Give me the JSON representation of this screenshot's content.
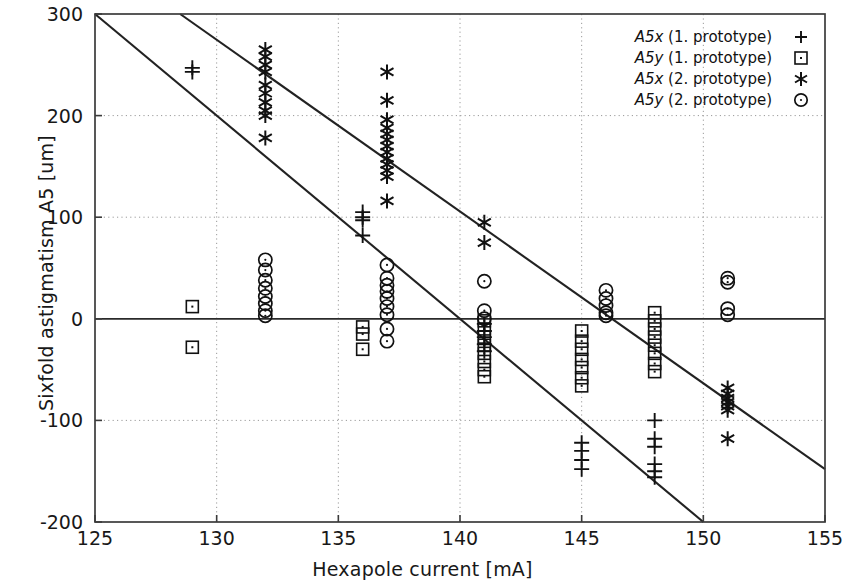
{
  "chart_data": {
    "type": "scatter",
    "title": "",
    "xlabel": "Hexapole current [mA]",
    "ylabel": "Sixfold astigmatism A5 [um]",
    "xlim": [
      125,
      155
    ],
    "ylim": [
      -200,
      300
    ],
    "xticks": [
      125,
      130,
      135,
      140,
      145,
      150,
      155
    ],
    "yticks": [
      -200,
      -100,
      0,
      100,
      200,
      300
    ],
    "grid": true,
    "grid_style": "dotted",
    "legend_position": "top-right",
    "legend": [
      {
        "label": "A5x (1. prototype)",
        "italic_part": "A5x",
        "rest": " (1. prototype)",
        "marker": "plus"
      },
      {
        "label": "A5y (1. prototype)",
        "italic_part": "A5y",
        "rest": " (1. prototype)",
        "marker": "square"
      },
      {
        "label": "A5x (2. prototype)",
        "italic_part": "A5x",
        "rest": " (2. prototype)",
        "marker": "asterisk"
      },
      {
        "label": "A5y (2. prototype)",
        "italic_part": "A5y",
        "rest": " (2. prototype)",
        "marker": "circle"
      }
    ],
    "series": [
      {
        "name": "A5x (1. prototype)",
        "marker": "plus",
        "points": [
          [
            129,
            247
          ],
          [
            129,
            243
          ],
          [
            136,
            105
          ],
          [
            136,
            100
          ],
          [
            136,
            97
          ],
          [
            136,
            82
          ],
          [
            141,
            -5
          ],
          [
            141,
            -12
          ],
          [
            141,
            -18
          ],
          [
            141,
            -25
          ],
          [
            141,
            -32
          ],
          [
            145,
            -122
          ],
          [
            145,
            -130
          ],
          [
            145,
            -139
          ],
          [
            145,
            -148
          ],
          [
            148,
            -100
          ],
          [
            148,
            -118
          ],
          [
            148,
            -126
          ],
          [
            148,
            -143
          ],
          [
            148,
            -150
          ],
          [
            148,
            -156
          ]
        ]
      },
      {
        "name": "A5y (1. prototype)",
        "marker": "square",
        "points": [
          [
            129,
            12
          ],
          [
            129,
            -28
          ],
          [
            136,
            -8
          ],
          [
            136,
            -15
          ],
          [
            136,
            -30
          ],
          [
            141,
            -2
          ],
          [
            141,
            -10
          ],
          [
            141,
            -18
          ],
          [
            141,
            -26
          ],
          [
            141,
            -34
          ],
          [
            141,
            -42
          ],
          [
            141,
            -50
          ],
          [
            141,
            -57
          ],
          [
            145,
            -12
          ],
          [
            145,
            -22
          ],
          [
            145,
            -30
          ],
          [
            145,
            -40
          ],
          [
            145,
            -48
          ],
          [
            145,
            -58
          ],
          [
            145,
            -66
          ],
          [
            148,
            6
          ],
          [
            148,
            -2
          ],
          [
            148,
            -10
          ],
          [
            148,
            -18
          ],
          [
            148,
            -26
          ],
          [
            148,
            -34
          ],
          [
            148,
            -44
          ],
          [
            148,
            -52
          ]
        ]
      },
      {
        "name": "A5x (2. prototype)",
        "marker": "asterisk",
        "points": [
          [
            132,
            265
          ],
          [
            132,
            258
          ],
          [
            132,
            250
          ],
          [
            132,
            243
          ],
          [
            132,
            230
          ],
          [
            132,
            222
          ],
          [
            132,
            213
          ],
          [
            132,
            205
          ],
          [
            132,
            200
          ],
          [
            132,
            178
          ],
          [
            137,
            243
          ],
          [
            137,
            215
          ],
          [
            137,
            196
          ],
          [
            137,
            188
          ],
          [
            137,
            182
          ],
          [
            137,
            176
          ],
          [
            137,
            170
          ],
          [
            137,
            164
          ],
          [
            137,
            158
          ],
          [
            137,
            152
          ],
          [
            137,
            146
          ],
          [
            137,
            140
          ],
          [
            137,
            116
          ],
          [
            141,
            95
          ],
          [
            141,
            75
          ],
          [
            151,
            -68
          ],
          [
            151,
            -74
          ],
          [
            151,
            -78
          ],
          [
            151,
            -82
          ],
          [
            151,
            -86
          ],
          [
            151,
            -90
          ],
          [
            151,
            -118
          ]
        ]
      },
      {
        "name": "A5y (2. prototype)",
        "marker": "circle",
        "points": [
          [
            132,
            58
          ],
          [
            132,
            48
          ],
          [
            132,
            38
          ],
          [
            132,
            30
          ],
          [
            132,
            22
          ],
          [
            132,
            15
          ],
          [
            132,
            8
          ],
          [
            132,
            3
          ],
          [
            137,
            53
          ],
          [
            137,
            40
          ],
          [
            137,
            33
          ],
          [
            137,
            27
          ],
          [
            137,
            20
          ],
          [
            137,
            12
          ],
          [
            137,
            4
          ],
          [
            137,
            -10
          ],
          [
            137,
            -22
          ],
          [
            141,
            37
          ],
          [
            141,
            8
          ],
          [
            141,
            0
          ],
          [
            146,
            28
          ],
          [
            146,
            20
          ],
          [
            146,
            13
          ],
          [
            146,
            6
          ],
          [
            146,
            3
          ],
          [
            151,
            40
          ],
          [
            151,
            36
          ],
          [
            151,
            10
          ],
          [
            151,
            4
          ]
        ]
      }
    ],
    "fit_lines": [
      {
        "name": "A5x fit (upper)",
        "x0": 128.5,
        "y0": 300,
        "x1": 155,
        "y1": -148
      },
      {
        "name": "A5y fit (lower)",
        "x0": 125,
        "y0": 300,
        "x1": 150,
        "y1": -200
      }
    ],
    "zero_line": 0
  },
  "axes": {
    "x_title": "Hexapole current [mA]",
    "y_title": "Sixfold astigmatism A5 [um]",
    "x_tick_labels": [
      "125",
      "130",
      "135",
      "140",
      "145",
      "150",
      "155"
    ],
    "y_tick_labels": [
      "300",
      "200",
      "100",
      "0",
      "-100",
      "-200"
    ]
  },
  "colors": {
    "marker": "#111111",
    "frame": "#3b3b3b",
    "grid": "#9a9a9a",
    "fit_line": "#222222",
    "background": "#ffffff"
  }
}
